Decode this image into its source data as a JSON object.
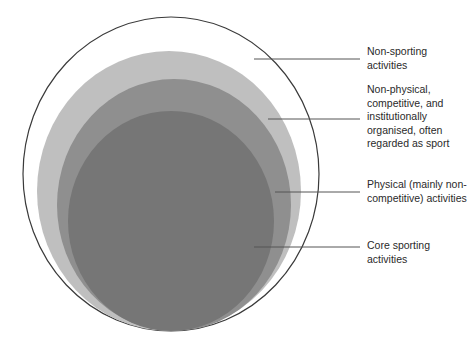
{
  "diagram": {
    "type": "nested-circles",
    "colors": {
      "outer_stroke": "#3a3a3a",
      "non_physical_fill": "#bfbfbf",
      "physical_fill": "#8f8f8f",
      "core_fill": "#767676",
      "leader_line": "#555555"
    },
    "layers": [
      {
        "id": "non-sporting",
        "label": "Non-sporting activities"
      },
      {
        "id": "non-physical",
        "label": "Non-physical, competitive, and institutionally organised, often regarded as sport"
      },
      {
        "id": "physical",
        "label": "Physical (mainly non-competitive) activities"
      },
      {
        "id": "core",
        "label": "Core sporting activities"
      }
    ]
  }
}
